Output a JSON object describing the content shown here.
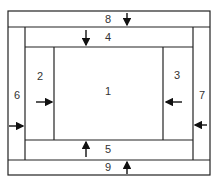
{
  "diagram": {
    "regions": [
      {
        "id": "1",
        "label": "1"
      },
      {
        "id": "2",
        "label": "2"
      },
      {
        "id": "3",
        "label": "3"
      },
      {
        "id": "4",
        "label": "4"
      },
      {
        "id": "5",
        "label": "5"
      },
      {
        "id": "6",
        "label": "6"
      },
      {
        "id": "7",
        "label": "7"
      },
      {
        "id": "8",
        "label": "8"
      },
      {
        "id": "9",
        "label": "9"
      }
    ],
    "arrows": [
      {
        "region": "8",
        "direction": "down"
      },
      {
        "region": "4",
        "direction": "down"
      },
      {
        "region": "2",
        "direction": "right"
      },
      {
        "region": "3",
        "direction": "left"
      },
      {
        "region": "6",
        "direction": "right"
      },
      {
        "region": "7",
        "direction": "left"
      },
      {
        "region": "5",
        "direction": "up"
      },
      {
        "region": "9",
        "direction": "up"
      }
    ],
    "line_color": "#222222"
  }
}
